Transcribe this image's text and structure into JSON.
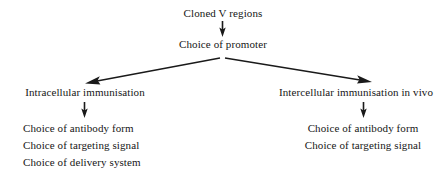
{
  "diagram": {
    "title_node": {
      "label": "Cloned V regions"
    },
    "promoter_node": {
      "label": "Choice of promoter"
    },
    "left_branch": {
      "heading": "Intracellular immunisation",
      "items": [
        "Choice of antibody form",
        "Choice of targeting signal",
        "Choice of delivery system"
      ]
    },
    "right_branch": {
      "heading": "Intercellular immunisation in vivo",
      "items": [
        "Choice of antibody form",
        "Choice of targeting signal"
      ]
    },
    "colors": {
      "background": "#ffffff",
      "text": "#161616",
      "arrow": "#1a1a1a"
    },
    "arrows": [
      {
        "name": "arrow-cloned-to-promoter",
        "direction": "down"
      },
      {
        "name": "arrow-promoter-to-intracellular",
        "direction": "down-left"
      },
      {
        "name": "arrow-promoter-to-intercellular",
        "direction": "down-right"
      },
      {
        "name": "arrow-intracellular-to-list",
        "direction": "down"
      },
      {
        "name": "arrow-intercellular-to-list",
        "direction": "down"
      }
    ]
  }
}
